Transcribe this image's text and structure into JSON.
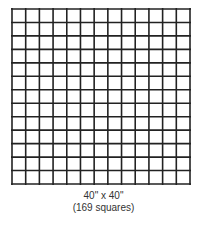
{
  "diagram": {
    "type": "square-grid",
    "rows": 13,
    "cols": 13,
    "line_color": "#222222",
    "background": "#ffffff"
  },
  "caption": {
    "dimensions": "40\" x 40\"",
    "count": "(169 squares)"
  }
}
